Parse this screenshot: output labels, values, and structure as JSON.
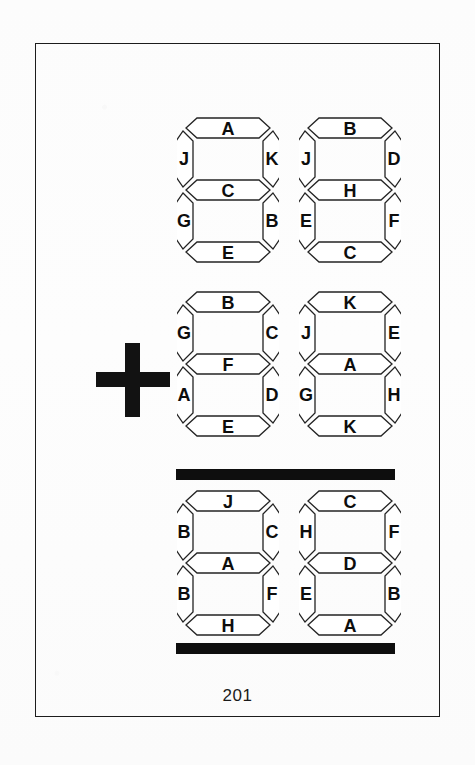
{
  "page": {
    "number": "201",
    "background_color": "#fdfdfd",
    "frame_color": "#1c1c1c",
    "ink_color": "#121212"
  },
  "operator": {
    "name": "plus",
    "glyph": "+"
  },
  "rules": [
    {
      "name": "addition-bar-top"
    },
    {
      "name": "addition-bar-bottom"
    }
  ],
  "puzzle": {
    "rows": [
      {
        "role": "addend-1",
        "digits": [
          {
            "id": "r0c0",
            "segments": {
              "top": "A",
              "top_left": "J",
              "top_right": "K",
              "middle": "C",
              "bottom_left": "G",
              "bottom_right": "B",
              "bottom": "E"
            }
          },
          {
            "id": "r0c1",
            "segments": {
              "top": "B",
              "top_left": "J",
              "top_right": "D",
              "middle": "H",
              "bottom_left": "E",
              "bottom_right": "F",
              "bottom": "C"
            }
          }
        ]
      },
      {
        "role": "addend-2",
        "digits": [
          {
            "id": "r1c0",
            "segments": {
              "top": "B",
              "top_left": "G",
              "top_right": "C",
              "middle": "F",
              "bottom_left": "A",
              "bottom_right": "D",
              "bottom": "E"
            }
          },
          {
            "id": "r1c1",
            "segments": {
              "top": "K",
              "top_left": "J",
              "top_right": "E",
              "middle": "A",
              "bottom_left": "G",
              "bottom_right": "H",
              "bottom": "K"
            }
          }
        ]
      },
      {
        "role": "sum",
        "digits": [
          {
            "id": "r2c0",
            "segments": {
              "top": "J",
              "top_left": "B",
              "top_right": "C",
              "middle": "A",
              "bottom_left": "B",
              "bottom_right": "F",
              "bottom": "H"
            }
          },
          {
            "id": "r2c1",
            "segments": {
              "top": "C",
              "top_left": "H",
              "top_right": "F",
              "middle": "D",
              "bottom_left": "E",
              "bottom_right": "B",
              "bottom": "A"
            }
          }
        ]
      }
    ]
  }
}
